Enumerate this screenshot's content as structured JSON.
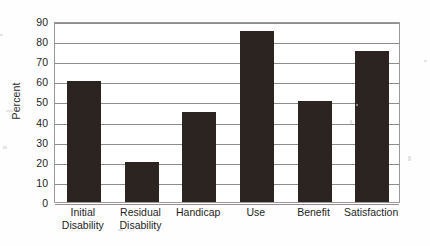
{
  "chart_data": {
    "type": "bar",
    "title": "",
    "subtitle": "",
    "xlabel": "",
    "ylabel": "Percent",
    "categories": [
      "Initial Disability",
      "Residual Disability",
      "Handicap",
      "Use",
      "Benefit",
      "Satisfaction"
    ],
    "category_lines": [
      [
        "Initial",
        "Disability"
      ],
      [
        "Residual",
        "Disability"
      ],
      [
        "Handicap",
        ""
      ],
      [
        "Use",
        ""
      ],
      [
        "Benefit",
        ""
      ],
      [
        "Satisfaction",
        ""
      ]
    ],
    "values": [
      60,
      20,
      45,
      85,
      50,
      75
    ],
    "ylim": [
      0,
      90
    ],
    "ytick_step": 10,
    "yticks": [
      0,
      10,
      20,
      30,
      40,
      50,
      60,
      70,
      80,
      90
    ],
    "ytick_labels": [
      "0",
      "10",
      "20",
      "30",
      "40",
      "50",
      "60",
      "70",
      "80",
      "90"
    ],
    "grid": true,
    "grid_axis": "y",
    "legend": false,
    "legend_position": "none",
    "bar_color": "#2b2420",
    "grid_color": "#8d8d8d",
    "axis_color": "#9a9a9a",
    "background_color": "#ffffff"
  }
}
